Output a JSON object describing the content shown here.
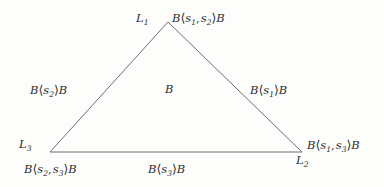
{
  "figure": {
    "type": "triangle-diagram",
    "background_color": "#fdfdfc",
    "line_color": "#6e6e6e",
    "text_color": "#2e2e2e",
    "vertices": {
      "apex": {
        "x": 168,
        "y": 22,
        "label": "L1"
      },
      "bottom_left": {
        "x": 50,
        "y": 152,
        "label": "L3"
      },
      "bottom_right": {
        "x": 302,
        "y": 152,
        "label": "L2"
      }
    }
  },
  "vertex_labels": {
    "l1": {
      "base": "L",
      "sub": "1"
    },
    "l2": {
      "base": "L",
      "sub": "2"
    },
    "l3": {
      "base": "L",
      "sub": "3"
    }
  },
  "region_labels": {
    "top_right": {
      "text": "B⟨s₁, s₂⟩B",
      "left": "B",
      "args": [
        "s1",
        "s2"
      ],
      "right": "B"
    },
    "left": {
      "text": "B⟨s₂⟩B",
      "left": "B",
      "args": [
        "s2"
      ],
      "right": "B"
    },
    "center": {
      "text": "B",
      "left": "B",
      "args": [],
      "right": ""
    },
    "right": {
      "text": "B⟨s₁⟩B",
      "left": "B",
      "args": [
        "s1"
      ],
      "right": "B"
    },
    "bottom_left": {
      "text": "B⟨s₂, s₃⟩B",
      "left": "B",
      "args": [
        "s2",
        "s3"
      ],
      "right": "B"
    },
    "bottom_center": {
      "text": "B⟨s₃⟩B",
      "left": "B",
      "args": [
        "s3"
      ],
      "right": "B"
    },
    "bottom_right": {
      "text": "B⟨s₁, s₃⟩B",
      "left": "B",
      "args": [
        "s1",
        "s3"
      ],
      "right": "B"
    }
  },
  "glyphs": {
    "angle_open": "⟨",
    "angle_close": "⟩",
    "comma": ","
  }
}
